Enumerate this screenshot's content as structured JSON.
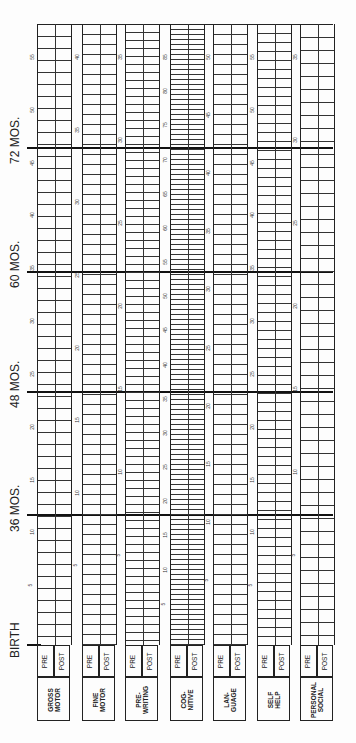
{
  "form": {
    "age_markers": [
      {
        "label": "72 MOS.",
        "y": 148
      },
      {
        "label": "60 MOS.",
        "y": 272
      },
      {
        "label": "48 MOS.",
        "y": 392
      },
      {
        "label": "36 MOS.",
        "y": 515
      },
      {
        "label": "BIRTH",
        "y": 645
      }
    ],
    "sub_labels": {
      "pre": "PRE",
      "post": "POST"
    },
    "domains": [
      {
        "id": "gross-motor",
        "line1": "GROSS",
        "line2": "MOTOR",
        "x": 37,
        "labels": [
          "55",
          "50",
          "45",
          "40",
          "35",
          "30",
          "25",
          "20",
          "15",
          "10",
          "5"
        ]
      },
      {
        "id": "fine-motor",
        "line1": "FINE",
        "line2": "MOTOR",
        "x": 82,
        "labels": [
          "40",
          "35",
          "30",
          "25",
          "20",
          "15",
          "10",
          "5"
        ]
      },
      {
        "id": "pre-writing",
        "line1": "PRE-",
        "line2": "WRITING",
        "x": 125,
        "labels": [
          "35",
          "30",
          "25",
          "20",
          "15",
          "10",
          "5"
        ]
      },
      {
        "id": "cognitive",
        "line1": "COG-",
        "line2": "NITIVE",
        "x": 170,
        "labels": [
          "85",
          "80",
          "75",
          "70",
          "65",
          "60",
          "55",
          "50",
          "45",
          "40",
          "35",
          "30",
          "25",
          "20",
          "15",
          "10",
          "5"
        ]
      },
      {
        "id": "language",
        "line1": "LAN-",
        "line2": "GUAGE",
        "x": 213,
        "labels": [
          "50",
          "45",
          "40",
          "35",
          "30",
          "25",
          "20",
          "15",
          "10",
          "5"
        ]
      },
      {
        "id": "self-help",
        "line1": "SELF",
        "line2": "HELP",
        "x": 257,
        "labels": [
          "55",
          "50",
          "45",
          "40",
          "35",
          "30",
          "25",
          "20",
          "15",
          "10",
          "5"
        ]
      },
      {
        "id": "personal-social",
        "line1": "PERSONAL",
        "line2": "SOCIAL",
        "x": 300,
        "labels": [
          "35",
          "30",
          "25",
          "20",
          "15",
          "10",
          "5"
        ]
      }
    ]
  }
}
